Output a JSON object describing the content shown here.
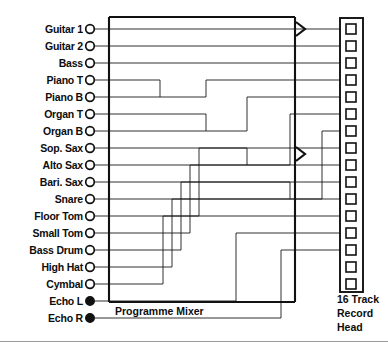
{
  "figure": {
    "line_color": "#1a1a1a",
    "box_color": "#111111",
    "background": "#ffffff"
  },
  "inputs": {
    "count": 16,
    "channels": [
      {
        "label": "Guitar 1",
        "jack": "open",
        "track": 1
      },
      {
        "label": "Guitar 2",
        "jack": "open",
        "track": 2
      },
      {
        "label": "Bass",
        "jack": "open",
        "track": 3
      },
      {
        "label": "Piano T",
        "jack": "open",
        "track": 4
      },
      {
        "label": "Piano B",
        "jack": "open",
        "track": 5
      },
      {
        "label": "Organ T",
        "jack": "open",
        "track": 6
      },
      {
        "label": "Organ B",
        "jack": "open",
        "track": 7
      },
      {
        "label": "Sop. Sax",
        "jack": "open",
        "track": 8
      },
      {
        "label": "Alto Sax",
        "jack": "open",
        "track": 9
      },
      {
        "label": "Bari. Sax",
        "jack": "open",
        "track": 10
      },
      {
        "label": "Snare",
        "jack": "open",
        "track": 11
      },
      {
        "label": "Floor Tom",
        "jack": "open",
        "track": 12
      },
      {
        "label": "Small Tom",
        "jack": "open",
        "track": 13
      },
      {
        "label": "Bass Drum",
        "jack": "open",
        "track": 14
      },
      {
        "label": "High Hat",
        "jack": "open",
        "track": 15
      },
      {
        "label": "Cymbal",
        "jack": "open",
        "track": 16
      },
      {
        "label": "Echo L",
        "jack": "filled",
        "track": 17
      },
      {
        "label": "Echo R",
        "jack": "filled",
        "track": 18
      }
    ]
  },
  "mixer": {
    "caption": "Programme Mixer"
  },
  "record_head": {
    "caption_line_1": "16 Track",
    "caption_line_2": "Record",
    "caption_line_3": "Head",
    "pad_count": 16
  },
  "arrows": {
    "count": 2,
    "glyph": "chevron-right"
  }
}
